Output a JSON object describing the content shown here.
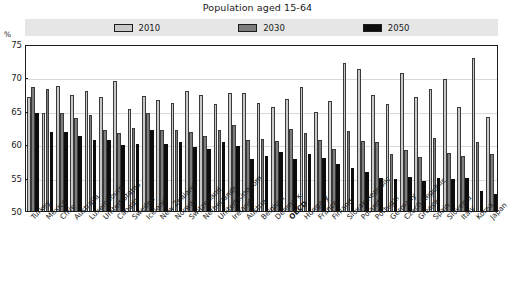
{
  "chart_data": {
    "type": "bar",
    "title": "Population aged 15-64",
    "xlabel": "",
    "ylabel": "%",
    "ylim": [
      50,
      75
    ],
    "yticks": [
      50,
      55,
      60,
      65,
      70,
      75
    ],
    "grid": true,
    "legend_position": "top-center",
    "categories": [
      "Turkey",
      "Mexico",
      "Chile",
      "Australia",
      "Luxembourg",
      "United States",
      "Canada",
      "Sweden",
      "Iceland",
      "New Zealand",
      "Norway",
      "Switzerland",
      "Netherlands",
      "United Kingdom",
      "Ireland",
      "Austria",
      "Belgium",
      "Denmark",
      "OECD",
      "Hungary",
      "France",
      "Finland",
      "Slovak Republic",
      "Poland",
      "Portugal",
      "Germany",
      "Czech Republic",
      "Greece",
      "Spain",
      "Slovenia",
      "Italy",
      "Korea",
      "Japan"
    ],
    "highlight_category": "OECD",
    "series": [
      {
        "name": "2010",
        "color": "#c9c9c9",
        "values": [
          67.0,
          64.7,
          68.7,
          67.4,
          68.0,
          67.0,
          69.4,
          65.3,
          67.2,
          66.6,
          66.2,
          68.0,
          67.4,
          66.0,
          67.6,
          67.6,
          66.1,
          65.5,
          66.8,
          68.6,
          64.8,
          66.5,
          72.1,
          71.3,
          67.3,
          66.0,
          70.6,
          67.0,
          68.2,
          69.8,
          65.6,
          72.9,
          64.0
        ]
      },
      {
        "name": "2030",
        "color": "#7d7d7d",
        "values": [
          68.6,
          68.2,
          64.6,
          63.9,
          64.3,
          62.2,
          61.7,
          62.4,
          64.6,
          62.2,
          62.1,
          61.8,
          61.3,
          62.2,
          62.9,
          60.7,
          60.8,
          60.5,
          62.3,
          61.7,
          60.6,
          59.3,
          62.0,
          60.5,
          60.4,
          58.6,
          59.2,
          58.1,
          60.9,
          58.7,
          58.2,
          60.4,
          58.5
        ]
      },
      {
        "name": "2050",
        "color": "#0d0d0d",
        "values": [
          64.7,
          61.8,
          61.9,
          61.3,
          60.6,
          60.7,
          59.9,
          60.1,
          62.1,
          60.0,
          60.4,
          59.6,
          59.3,
          60.4,
          59.8,
          57.8,
          58.3,
          58.9,
          57.8,
          58.5,
          57.9,
          57.1,
          56.5,
          55.8,
          55.0,
          54.8,
          55.1,
          54.5,
          54.9,
          54.8,
          54.9,
          53.0,
          52.5
        ]
      }
    ]
  },
  "legend": {
    "items": [
      {
        "label": "2010",
        "color": "#c9c9c9"
      },
      {
        "label": "2030",
        "color": "#7d7d7d"
      },
      {
        "label": "2050",
        "color": "#0d0d0d"
      }
    ]
  }
}
